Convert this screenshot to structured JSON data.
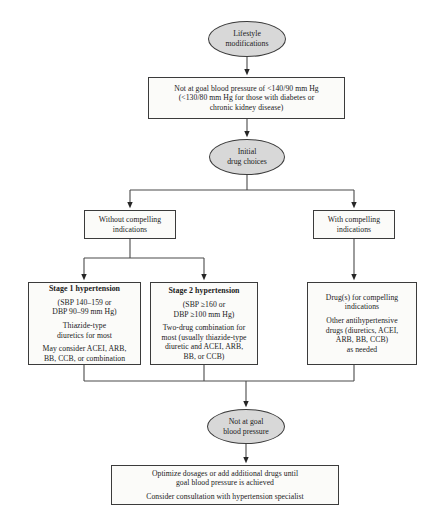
{
  "diagram": {
    "accent_color": "#d8d8d8",
    "line_color": "#3b3b3b",
    "box_fill": "#fbfbf9"
  },
  "nodes": {
    "lifestyle": {
      "shape": "ellipse",
      "lines": [
        "Lifestyle",
        "modifications"
      ]
    },
    "not_at_goal_1": {
      "shape": "box",
      "lines": [
        "Not at goal blood pressure of <140/90 mm Hg",
        "(<130/80 mm Hg for those with diabetes or",
        "chronic kidney disease)"
      ]
    },
    "initial_drug_choices": {
      "shape": "ellipse",
      "lines": [
        "Initial",
        "drug choices"
      ]
    },
    "without_compelling": {
      "shape": "box",
      "lines": [
        "Without compelling",
        "indications"
      ]
    },
    "with_compelling": {
      "shape": "box",
      "lines": [
        "With compelling",
        "indications"
      ]
    },
    "stage_1": {
      "shape": "box",
      "heading": "Stage 1 hypertension",
      "paragraphs": [
        [
          "(SBP 140–159 or",
          "DBP 90–99 mm Hg)"
        ],
        [
          "Thiazide-type",
          "diuretics for most"
        ],
        [
          "May consider ACEI, ARB,",
          "BB, CCB, or combination"
        ]
      ]
    },
    "stage_2": {
      "shape": "box",
      "heading": "Stage 2 hypertension",
      "paragraphs": [
        [
          "(SBP ≥160 or",
          "DBP ≥100 mm Hg)"
        ],
        [
          "Two-drug combination for",
          "most (usually thiazide-type",
          "diuretic and ACEI, ARB,",
          "BB, or CCB)"
        ]
      ]
    },
    "compelling_drugs": {
      "shape": "box",
      "paragraphs": [
        [
          "Drug(s) for compelling",
          "indications"
        ],
        [
          "Other antihypertensive",
          "drugs (diuretics, ACEI,",
          "ARB, BB, CCB)",
          "as needed"
        ]
      ]
    },
    "not_at_goal_2": {
      "shape": "ellipse",
      "lines": [
        "Not at goal",
        "blood pressure"
      ]
    },
    "optimize": {
      "shape": "box",
      "paragraphs": [
        [
          "Optimize dosages or add additional drugs until",
          "goal blood pressure is achieved"
        ],
        [
          "Consider consultation with hypertension specialist"
        ]
      ]
    }
  }
}
